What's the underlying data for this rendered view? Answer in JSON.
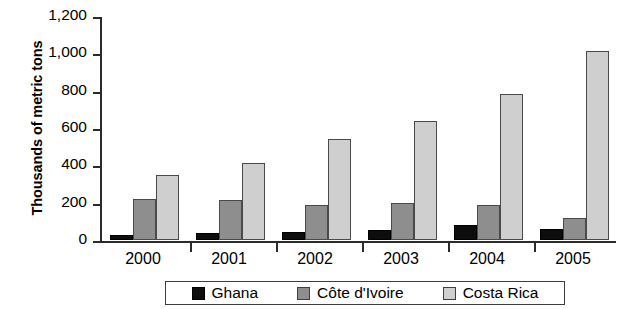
{
  "chart_data": {
    "type": "bar",
    "title": "",
    "xlabel": "",
    "ylabel": "Thousands of metric tons",
    "categories": [
      "2000",
      "2001",
      "2002",
      "2003",
      "2004",
      "2005"
    ],
    "series": [
      {
        "name": "Ghana",
        "color": "#0d0d0d",
        "values": [
          25,
          35,
          45,
          55,
          80,
          60
        ]
      },
      {
        "name": "Côte d'Ivoire",
        "color": "#8e8e8e",
        "values": [
          218,
          212,
          188,
          200,
          185,
          120
        ]
      },
      {
        "name": "Costa Rica",
        "color": "#cfcfcf",
        "values": [
          350,
          415,
          540,
          635,
          780,
          1010
        ]
      }
    ],
    "ylim": [
      0,
      1200
    ],
    "yticks": [
      0,
      200,
      400,
      600,
      800,
      1000,
      1200
    ],
    "ytick_labels": [
      "0",
      "200",
      "400",
      "600",
      "800",
      "1,000",
      "1,200"
    ],
    "grid": false,
    "legend_position": "bottom"
  }
}
